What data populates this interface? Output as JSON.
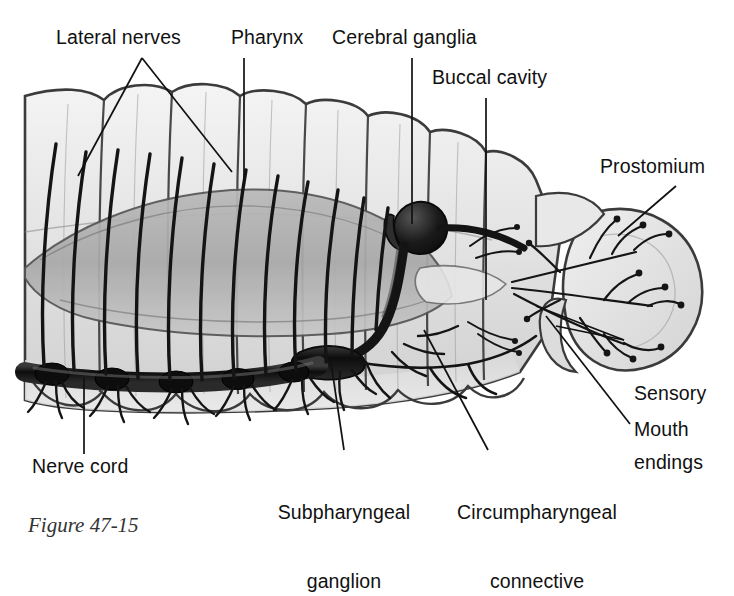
{
  "figure": {
    "kind": "anatomical-diagram",
    "background_color": "#ffffff",
    "ink_color": "#111111",
    "caption_fragment": "Figure 47-15"
  },
  "labels": [
    {
      "id": "lateral-nerves",
      "text": "Lateral nerves",
      "lines": [
        "Lateral nerves"
      ]
    },
    {
      "id": "pharynx",
      "text": "Pharynx",
      "lines": [
        "Pharynx"
      ]
    },
    {
      "id": "cerebral-ganglia",
      "text": "Cerebral ganglia",
      "lines": [
        "Cerebral ganglia"
      ]
    },
    {
      "id": "buccal-cavity",
      "text": "Buccal cavity",
      "lines": [
        "Buccal cavity"
      ]
    },
    {
      "id": "prostomium",
      "text": "Prostomium",
      "lines": [
        "Prostomium"
      ]
    },
    {
      "id": "sensory-endings",
      "text": "Sensory endings",
      "lines": [
        "Sensory",
        "endings"
      ]
    },
    {
      "id": "mouth",
      "text": "Mouth",
      "lines": [
        "Mouth"
      ]
    },
    {
      "id": "nerve-cord",
      "text": "Nerve cord",
      "lines": [
        "Nerve cord"
      ]
    },
    {
      "id": "subpharyngeal-ganglion",
      "text": "Subpharyngeal ganglion",
      "lines": [
        "Subpharyngeal",
        "ganglion"
      ]
    },
    {
      "id": "circumpharyngeal-connective",
      "text": "Circumpharyngeal connective",
      "lines": [
        "Circumpharyngeal",
        "connective"
      ]
    }
  ],
  "structures": [
    {
      "id": "body-segments",
      "name": "segmented body wall"
    },
    {
      "id": "pharynx-mass",
      "name": "pharynx"
    },
    {
      "id": "cerebral-ganglia-body",
      "name": "cerebral ganglia (brain)"
    },
    {
      "id": "circumpharyngeal-connective-body",
      "name": "circumpharyngeal connective"
    },
    {
      "id": "subpharyngeal-ganglion-body",
      "name": "subpharyngeal ganglion"
    },
    {
      "id": "ventral-nerve-cord",
      "name": "ventral nerve cord"
    },
    {
      "id": "lateral-nerve-fibers",
      "name": "lateral nerves"
    },
    {
      "id": "prostomium-lobe",
      "name": "prostomium"
    },
    {
      "id": "sensory-nerve-endings",
      "name": "sensory endings"
    },
    {
      "id": "mouth-opening",
      "name": "mouth"
    },
    {
      "id": "buccal-cavity-space",
      "name": "buccal cavity"
    }
  ]
}
